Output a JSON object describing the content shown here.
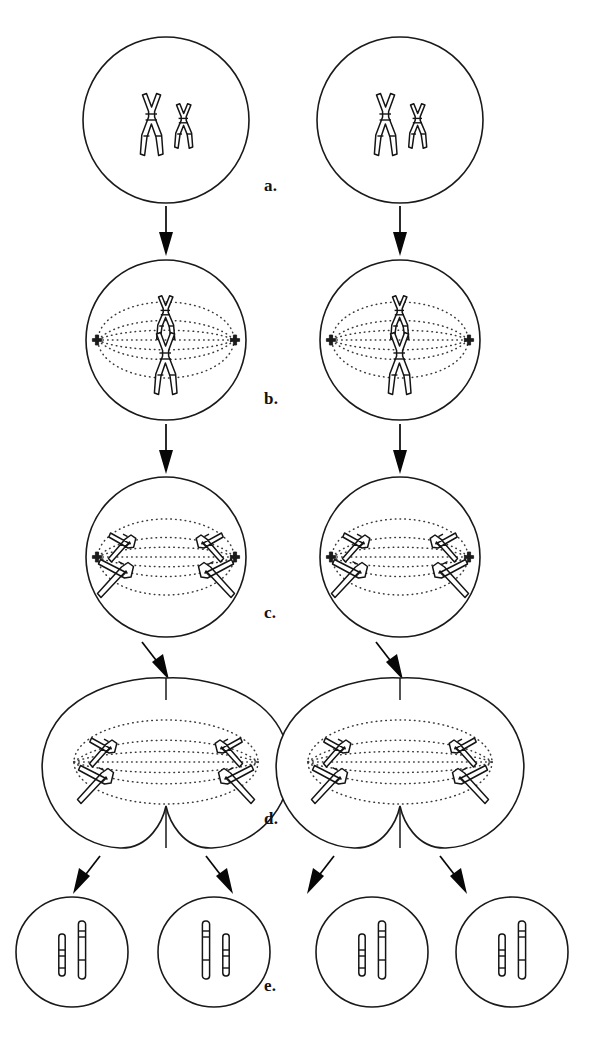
{
  "figure": {
    "background_color": "#ffffff",
    "ink_color": "#141414",
    "spindle_color": "#3a3a3a"
  },
  "stage_labels": [
    {
      "id": "a",
      "text": "a.",
      "x": 272,
      "y": 186,
      "stage_name": "prophase"
    },
    {
      "id": "b",
      "text": "b.",
      "x": 272,
      "y": 398,
      "stage_name": "metaphase"
    },
    {
      "id": "c",
      "text": "c.",
      "x": 272,
      "y": 612,
      "stage_name": "anaphase"
    },
    {
      "id": "d",
      "text": "d.",
      "x": 272,
      "y": 818,
      "stage_name": "telophase"
    },
    {
      "id": "e",
      "text": "e.",
      "x": 272,
      "y": 985,
      "stage_name": "daughter-cells"
    }
  ],
  "columns": [
    {
      "id": "left",
      "center_x": 166
    },
    {
      "id": "right",
      "center_x": 400
    }
  ],
  "rows": {
    "prophase": {
      "label": "a",
      "cell_center_y": 120,
      "cell_radius": 83,
      "chromosomes": [
        {
          "id": "long",
          "shape": "X",
          "size": "long",
          "offset_x": -14
        },
        {
          "id": "short",
          "shape": "X",
          "size": "short",
          "offset_x": 18
        }
      ]
    },
    "metaphase": {
      "label": "b",
      "cell_center_y": 340,
      "cell_radius": 80,
      "spindle": true,
      "centrioles": 2,
      "chromosomes": [
        {
          "id": "long",
          "shape": "X",
          "size": "long",
          "offset_y": 24
        },
        {
          "id": "short",
          "shape": "X",
          "size": "short",
          "offset_y": -22
        }
      ]
    },
    "anaphase": {
      "label": "c",
      "cell_center_y": 557,
      "cell_radius": 80,
      "spindle": true,
      "centrioles": 2,
      "chromosomes": [
        {
          "id": "upper-left",
          "shape": "V",
          "size": "short",
          "pole": "left"
        },
        {
          "id": "lower-left",
          "shape": "V",
          "size": "long",
          "pole": "left"
        },
        {
          "id": "upper-right",
          "shape": "V",
          "size": "short",
          "pole": "right"
        },
        {
          "id": "lower-right",
          "shape": "V",
          "size": "long",
          "pole": "right"
        }
      ]
    },
    "telophase": {
      "label": "d",
      "cell_center_y": 762,
      "cell_half_width": 126,
      "cell_half_height": 88,
      "cleavage_furrow": true,
      "spindle": true,
      "chromosomes": [
        {
          "id": "upper-left",
          "shape": "V",
          "size": "short",
          "pole": "left"
        },
        {
          "id": "lower-left",
          "shape": "V",
          "size": "long",
          "pole": "left"
        },
        {
          "id": "upper-right",
          "shape": "V",
          "size": "short",
          "pole": "right"
        },
        {
          "id": "lower-right",
          "shape": "V",
          "size": "long",
          "pole": "right"
        }
      ]
    },
    "daughter_cells": {
      "label": "e",
      "cell_center_y": 952,
      "cell_radius": 55,
      "cells_per_column": 2,
      "chromosomes": [
        {
          "id": "short-rod",
          "shape": "rod",
          "size": "short"
        },
        {
          "id": "long-rod",
          "shape": "rod",
          "size": "long"
        }
      ]
    }
  },
  "arrows": {
    "vertical": [
      {
        "from": "prophase",
        "to": "metaphase",
        "y_start": 206,
        "y_end": 256
      },
      {
        "from": "metaphase",
        "to": "anaphase",
        "y_start": 422,
        "y_end": 474
      },
      {
        "from": "anaphase",
        "to": "telophase",
        "y_start": 640,
        "y_end": 686,
        "angled": true
      }
    ],
    "split": [
      {
        "from": "telophase",
        "to": "daughter-left",
        "direction": "down-left"
      },
      {
        "from": "telophase",
        "to": "daughter-right",
        "direction": "down-right"
      }
    ]
  }
}
